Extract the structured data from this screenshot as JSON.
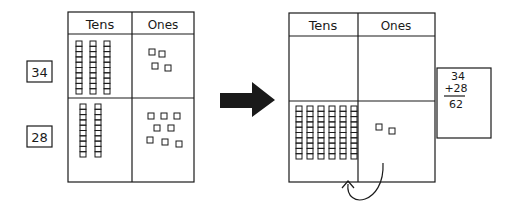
{
  "diagram": {
    "title": "",
    "left_chart": {
      "headers": [
        "Tens",
        "Ones"
      ],
      "rows": [
        {
          "label": "34",
          "tens": 3,
          "ones": 4
        },
        {
          "label": "28",
          "tens": 2,
          "ones": 8
        }
      ]
    },
    "arrow": "right-arrow",
    "right_chart": {
      "headers": [
        "Tens",
        "Ones"
      ],
      "rows": [
        {
          "tens": 0,
          "ones": 0
        },
        {
          "tens": 6,
          "ones": 2
        }
      ],
      "regroup_arrow": "curved-arrow-ones-to-tens"
    },
    "equation": {
      "addend1": "34",
      "addend2": "+28",
      "sum": "62"
    },
    "colors": {
      "ink": "#1a1a1a",
      "background": "#ffffff"
    }
  }
}
